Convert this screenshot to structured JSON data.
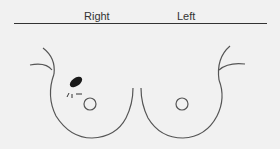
{
  "header": {
    "right_label": "Right",
    "left_label": "Left"
  },
  "diagram": {
    "stroke_color": "#555555",
    "lesion_color": "#1a1a1a"
  }
}
